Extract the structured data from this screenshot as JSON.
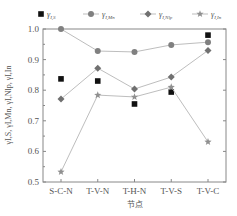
{
  "chart_data": {
    "type": "line",
    "title": "",
    "xlabel": "节点",
    "ylabel": "γI,S, γI,Mn, γI,Nlp, γI,In",
    "categories": [
      "S-C-N",
      "T-V-N",
      "T-H-N",
      "T-V-S",
      "T-V-C"
    ],
    "ylim": [
      0.5,
      1.0
    ],
    "yticks": [
      "0.5",
      "0.6",
      "0.7",
      "0.8",
      "0.9",
      "1.0"
    ],
    "grid": false,
    "legend_position": "top",
    "series": [
      {
        "name": "γI,S",
        "sub": "I,S",
        "marker": "square",
        "line": false,
        "color": "#111111",
        "values": [
          0.837,
          0.83,
          0.755,
          0.794,
          0.98
        ]
      },
      {
        "name": "γI,Mn",
        "sub": "I,Mn",
        "marker": "circle",
        "line": true,
        "color": "#808080",
        "values": [
          1.0,
          0.928,
          0.925,
          0.948,
          0.957
        ]
      },
      {
        "name": "γI,Nlp",
        "sub": "I,Nlp",
        "marker": "diamond",
        "line": true,
        "color": "#707070",
        "values": [
          0.771,
          0.872,
          0.804,
          0.843,
          0.93
        ]
      },
      {
        "name": "γI,In",
        "sub": "I,In",
        "marker": "star",
        "line": true,
        "color": "#909090",
        "values": [
          0.533,
          0.784,
          0.778,
          0.81,
          0.631
        ]
      }
    ]
  }
}
